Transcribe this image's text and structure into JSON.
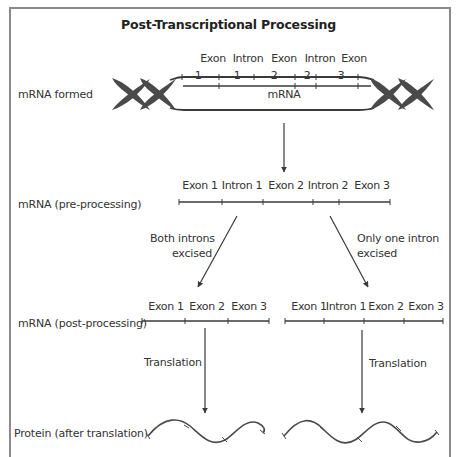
{
  "title": "Post-Transcriptional Processing",
  "rows": {
    "formed": "mRNA formed",
    "pre": "mRNA (pre-processing)",
    "post": "mRNA (post-processing)",
    "protein": "Protein (after translation)"
  },
  "dna": {
    "segments_top": [
      "Exon",
      "Intron",
      "Exon",
      "Intron",
      "Exon"
    ],
    "segments_num": [
      "1",
      "1",
      "2",
      "2",
      "3"
    ],
    "strand_label": "mRNA"
  },
  "pre_processing": {
    "segments": [
      "Exon 1",
      "Intron 1",
      "Exon 2",
      "Intron 2",
      "Exon 3"
    ]
  },
  "branches": {
    "left": {
      "line1": "Both introns",
      "line2": "excised"
    },
    "right": {
      "line1": "Only one intron",
      "line2": "excised"
    }
  },
  "post_processing": {
    "left_segments": [
      "Exon 1",
      "Exon 2",
      "Exon 3"
    ],
    "right_segments": [
      "Exon 1",
      "Intron 1",
      "Exon 2",
      "Exon 3"
    ]
  },
  "translation": {
    "left": "Translation",
    "right": "Translation"
  },
  "colors": {
    "line": "#3a3a3a",
    "frame": "#8a8a8a",
    "helix": "#4a4a4a"
  }
}
